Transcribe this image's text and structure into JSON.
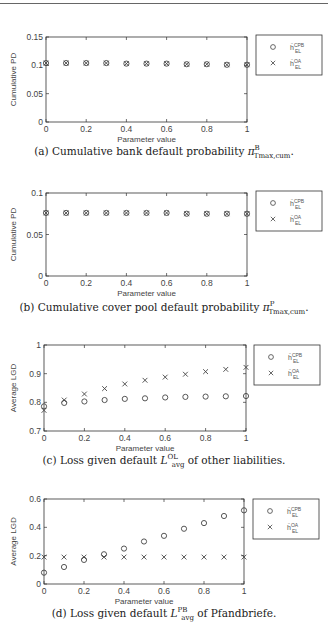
{
  "chart_data": [
    {
      "id": "a",
      "type": "scatter",
      "title": "",
      "caption": "(a) Cumulative bank default probability π^B_{T_max,cum}.",
      "caption_prefix": "(a) Cumulative bank default probability ",
      "caption_symbol": "π",
      "caption_sup": "B",
      "caption_sub": "Tmax,cum",
      "caption_suffix": ".",
      "xlabel": "Parameter value",
      "ylabel": "Cumulative PD",
      "xlim": [
        0,
        1
      ],
      "ylim": [
        0,
        0.15
      ],
      "xticks": [
        "0",
        "0.2",
        "0.4",
        "0.6",
        "0.8",
        "1"
      ],
      "yticks": [
        "0",
        "0.05",
        "0.1",
        "0.15"
      ],
      "grid": false,
      "legend_position": "outside-right",
      "x": [
        0,
        0.1,
        0.2,
        0.3,
        0.4,
        0.5,
        0.6,
        0.7,
        0.8,
        0.9,
        1.0
      ],
      "series": [
        {
          "name": "ĥ_EL^CPB",
          "marker": "o",
          "values": [
            0.104,
            0.104,
            0.104,
            0.104,
            0.103,
            0.103,
            0.103,
            0.102,
            0.102,
            0.101,
            0.101
          ]
        },
        {
          "name": "ĥ_EL^OA",
          "marker": "x",
          "values": [
            0.104,
            0.104,
            0.104,
            0.104,
            0.103,
            0.103,
            0.103,
            0.102,
            0.102,
            0.101,
            0.101
          ]
        }
      ]
    },
    {
      "id": "b",
      "type": "scatter",
      "title": "",
      "caption": "(b) Cumulative cover pool default probability π^P_{T_max,cum}.",
      "caption_prefix": "(b) Cumulative cover pool default probability ",
      "caption_symbol": "π",
      "caption_sup": "P",
      "caption_sub": "Tmax,cum",
      "caption_suffix": ".",
      "xlabel": "Parameter value",
      "ylabel": "Cumulative PD",
      "xlim": [
        0,
        1
      ],
      "ylim": [
        0,
        0.1
      ],
      "xticks": [
        "0",
        "0.2",
        "0.4",
        "0.6",
        "0.8",
        "1"
      ],
      "yticks": [
        "0",
        "0.05",
        "0.1"
      ],
      "grid": false,
      "legend_position": "outside-right",
      "x": [
        0,
        0.1,
        0.2,
        0.3,
        0.4,
        0.5,
        0.6,
        0.7,
        0.8,
        0.9,
        1.0
      ],
      "series": [
        {
          "name": "ĥ_EL^CPB",
          "marker": "o",
          "values": [
            0.076,
            0.076,
            0.076,
            0.076,
            0.076,
            0.076,
            0.076,
            0.075,
            0.075,
            0.075,
            0.075
          ]
        },
        {
          "name": "ĥ_EL^OA",
          "marker": "x",
          "values": [
            0.076,
            0.076,
            0.076,
            0.076,
            0.076,
            0.076,
            0.076,
            0.075,
            0.075,
            0.075,
            0.075
          ]
        }
      ]
    },
    {
      "id": "c",
      "type": "scatter",
      "title": "",
      "caption": "(c) Loss given default L^OL_avg of other liabilities.",
      "caption_prefix": "(c) Loss given default ",
      "caption_symbol": "L",
      "caption_sup": "OL",
      "caption_sub": "avg",
      "caption_suffix": " of other liabilities.",
      "xlabel": "Parameter value",
      "ylabel": "Average LGD",
      "xlim": [
        0,
        1
      ],
      "ylim": [
        0.7,
        1
      ],
      "xticks": [
        "0",
        "0.2",
        "0.4",
        "0.6",
        "0.8",
        "1"
      ],
      "yticks": [
        "0.7",
        "0.8",
        "0.9",
        "1"
      ],
      "grid": false,
      "legend_position": "outside-right",
      "x": [
        0,
        0.1,
        0.2,
        0.3,
        0.4,
        0.5,
        0.6,
        0.7,
        0.8,
        0.9,
        1.0
      ],
      "series": [
        {
          "name": "ĥ_EL^CPB",
          "marker": "o",
          "values": [
            0.786,
            0.798,
            0.803,
            0.808,
            0.812,
            0.814,
            0.817,
            0.819,
            0.82,
            0.821,
            0.822
          ]
        },
        {
          "name": "ĥ_EL^OA",
          "marker": "x",
          "values": [
            0.772,
            0.808,
            0.829,
            0.848,
            0.864,
            0.877,
            0.888,
            0.898,
            0.907,
            0.915,
            0.922
          ]
        }
      ]
    },
    {
      "id": "d",
      "type": "scatter",
      "title": "",
      "caption": "(d) Loss given default L^PB_avg of Pfandbriefe.",
      "caption_prefix": "(d) Loss given default ",
      "caption_symbol": "L",
      "caption_sup": "PB",
      "caption_sub": "avg",
      "caption_suffix": " of Pfandbriefe.",
      "xlabel": "Parameter value",
      "ylabel": "Average LGD",
      "xlim": [
        0,
        1
      ],
      "ylim": [
        0,
        0.6
      ],
      "xticks": [
        "0",
        "0.2",
        "0.4",
        "0.6",
        "0.8",
        "1"
      ],
      "yticks": [
        "0",
        "0.2",
        "0.4",
        "0.6"
      ],
      "grid": false,
      "legend_position": "outside-right",
      "x": [
        0,
        0.1,
        0.2,
        0.3,
        0.4,
        0.5,
        0.6,
        0.7,
        0.8,
        0.9,
        1.0
      ],
      "series": [
        {
          "name": "ĥ_EL^CPB",
          "marker": "o",
          "values": [
            0.08,
            0.12,
            0.17,
            0.21,
            0.25,
            0.3,
            0.34,
            0.39,
            0.43,
            0.48,
            0.52
          ]
        },
        {
          "name": "ĥ_EL^OA",
          "marker": "x",
          "values": [
            0.19,
            0.19,
            0.19,
            0.19,
            0.19,
            0.19,
            0.19,
            0.19,
            0.19,
            0.19,
            0.19
          ]
        }
      ]
    }
  ],
  "legend": {
    "entry1": {
      "base": "ĥ",
      "sup": "CPB",
      "sub": "EL"
    },
    "entry2": {
      "base": "ĥ",
      "sup": "OA",
      "sub": "EL"
    }
  },
  "layout": [
    {
      "top": 30,
      "plot": {
        "left": 46,
        "top": 37,
        "right": 247,
        "bottom": 122
      },
      "legend_box": {
        "left": 256,
        "top": 35,
        "width": 66,
        "height": 40
      },
      "caption_top": 144
    },
    {
      "top": 185,
      "plot": {
        "left": 46,
        "top": 193,
        "right": 247,
        "bottom": 276
      },
      "legend_box": {
        "left": 256,
        "top": 191,
        "width": 66,
        "height": 40
      },
      "caption_top": 300
    },
    {
      "top": 340,
      "plot": {
        "left": 44,
        "top": 345,
        "right": 246,
        "bottom": 431
      },
      "legend_box": {
        "left": 254,
        "top": 345,
        "width": 66,
        "height": 40
      },
      "caption_top": 453
    },
    {
      "top": 490,
      "plot": {
        "left": 44,
        "top": 499,
        "right": 244,
        "bottom": 584
      },
      "legend_box": {
        "left": 253,
        "top": 499,
        "width": 66,
        "height": 40
      },
      "caption_top": 606
    }
  ]
}
